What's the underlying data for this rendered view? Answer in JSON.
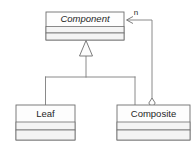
{
  "diagram": {
    "type": "uml-class-diagram",
    "background_color": "#ffffff",
    "line_color": "#7d7d7d",
    "box_fill_color": "#fdfdfd",
    "text_color": "#262626",
    "classes": [
      {
        "id": "component",
        "name": "Component",
        "abstract": true,
        "compartments": 3,
        "x": 46,
        "y": 12,
        "width": 78,
        "height": 28
      },
      {
        "id": "leaf",
        "name": "Leaf",
        "abstract": false,
        "compartments": 3,
        "x": 16,
        "y": 105,
        "width": 59,
        "height": 35
      },
      {
        "id": "composite",
        "name": "Composite",
        "abstract": false,
        "compartments": 3,
        "x": 117,
        "y": 105,
        "width": 73,
        "height": 35
      }
    ],
    "relationships": [
      {
        "id": "leaf-generalization",
        "kind": "generalization",
        "from": "Leaf",
        "to": "Component",
        "marker": "hollow-triangle"
      },
      {
        "id": "composite-generalization",
        "kind": "generalization",
        "from": "Composite",
        "to": "Component",
        "marker": "hollow-triangle"
      },
      {
        "id": "composite-aggregation",
        "kind": "aggregation",
        "from": "Composite",
        "to": "Component",
        "marker": "hollow-diamond",
        "multiplicity": "n",
        "navigable": true
      }
    ],
    "labels": {
      "multiplicity_n": "n"
    }
  }
}
